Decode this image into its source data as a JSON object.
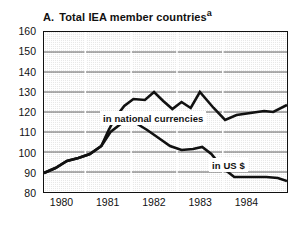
{
  "chart_data": {
    "type": "line",
    "title": "A. Total IEA member countries",
    "title_prefix": "A.",
    "title_main": "Total  IEA  member  countries",
    "footnote_marker": "a",
    "xlabel": "",
    "ylabel": "",
    "xlim": [
      1979.6,
      1984.9
    ],
    "ylim": [
      80,
      160
    ],
    "yticks": [
      160,
      150,
      140,
      130,
      120,
      110,
      100,
      90,
      80
    ],
    "xticks": [
      1980,
      1981,
      1982,
      1983,
      1984
    ],
    "xtick_labels": [
      "1980",
      "1981",
      "1982",
      "1983",
      "1984"
    ],
    "grid": true,
    "grid_axis": "y",
    "legend_position": "inline-annotation",
    "series": [
      {
        "name": "in national currencies",
        "label": "in national currencies",
        "color": "#111111",
        "points": [
          [
            1979.6,
            89.5
          ],
          [
            1979.85,
            92.0
          ],
          [
            1980.1,
            95.5
          ],
          [
            1980.35,
            97.0
          ],
          [
            1980.6,
            99.0
          ],
          [
            1980.85,
            103.0
          ],
          [
            1981.0,
            110.5
          ],
          [
            1981.15,
            117.0
          ],
          [
            1981.35,
            123.0
          ],
          [
            1981.55,
            126.5
          ],
          [
            1981.8,
            126.0
          ],
          [
            1982.0,
            130.0
          ],
          [
            1982.2,
            125.5
          ],
          [
            1982.4,
            121.5
          ],
          [
            1982.6,
            125.0
          ],
          [
            1982.8,
            122.0
          ],
          [
            1983.0,
            130.0
          ],
          [
            1983.3,
            122.0
          ],
          [
            1983.55,
            116.0
          ],
          [
            1983.8,
            118.5
          ],
          [
            1984.1,
            119.5
          ],
          [
            1984.4,
            120.5
          ],
          [
            1984.6,
            120.0
          ],
          [
            1984.9,
            123.5
          ]
        ]
      },
      {
        "name": "in US $",
        "label": "in US $",
        "color": "#111111",
        "points": [
          [
            1979.6,
            89.5
          ],
          [
            1979.85,
            92.0
          ],
          [
            1980.1,
            95.5
          ],
          [
            1980.35,
            97.0
          ],
          [
            1980.6,
            99.0
          ],
          [
            1980.85,
            103.0
          ],
          [
            1981.05,
            110.0
          ],
          [
            1981.3,
            114.5
          ],
          [
            1981.6,
            114.5
          ],
          [
            1981.85,
            111.0
          ],
          [
            1982.1,
            107.0
          ],
          [
            1982.35,
            103.0
          ],
          [
            1982.6,
            101.0
          ],
          [
            1982.85,
            101.5
          ],
          [
            1983.05,
            102.5
          ],
          [
            1983.25,
            99.0
          ],
          [
            1983.5,
            92.0
          ],
          [
            1983.75,
            87.5
          ],
          [
            1984.1,
            87.5
          ],
          [
            1984.45,
            87.5
          ],
          [
            1984.7,
            87.0
          ],
          [
            1984.9,
            85.5
          ]
        ]
      }
    ]
  }
}
